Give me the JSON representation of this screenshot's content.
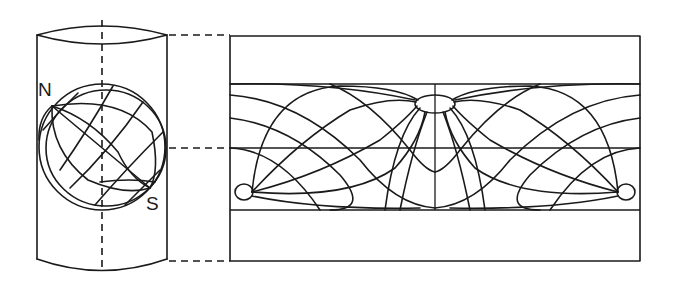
{
  "diagram": {
    "labels": {
      "north": "N",
      "south": "S"
    },
    "components": {
      "cylinder": "Cylinder enclosing globe with vertical dashed axis",
      "globe": "Globe with graticule, tilted so poles lie on cylinder side",
      "projection": "Unrolled cylinder map showing curved meridians and parallels",
      "connectors": "Dashed lines linking cylinder top, equator and bottom to map"
    },
    "colors": {
      "stroke": "#1a1a1a",
      "background": "#ffffff"
    }
  }
}
